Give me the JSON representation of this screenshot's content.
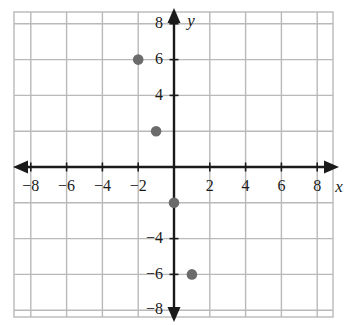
{
  "chart_data": {
    "type": "scatter",
    "title": "",
    "xlabel": "x",
    "ylabel": "y",
    "grid": true,
    "grid_step": 2,
    "legend": "none",
    "xlim": [
      -9,
      9
    ],
    "ylim": [
      -9,
      9
    ],
    "x_ticks": [
      -8,
      -6,
      -4,
      -2,
      2,
      4,
      6,
      8
    ],
    "y_ticks": [
      8,
      6,
      4,
      -4,
      -6,
      -8
    ],
    "x_tick_labels": [
      "−8",
      "−6",
      "−4",
      "−2",
      "2",
      "4",
      "6",
      "8"
    ],
    "y_tick_labels": [
      "8",
      "6",
      "4",
      "−4",
      "−6",
      "−8"
    ],
    "points": [
      {
        "x": -2,
        "y": 6,
        "label": "(−2, 6)"
      },
      {
        "x": -1,
        "y": 2,
        "label": "(−1, 2)"
      },
      {
        "x": 0,
        "y": -2,
        "label": "(0, −2)"
      },
      {
        "x": 1,
        "y": -6,
        "label": "(1, −6)"
      }
    ],
    "colors": {
      "point": "#6b6b6b",
      "axis": "#1a1a1a",
      "grid": "#b9b9b9",
      "background": "#ffffff",
      "text": "#1a1a1a"
    }
  }
}
